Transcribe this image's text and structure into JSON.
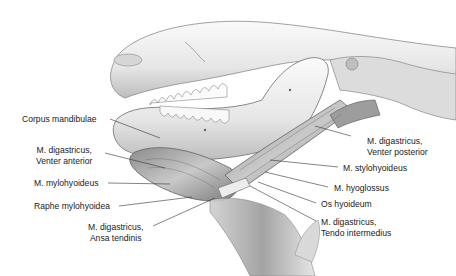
{
  "figure": {
    "labels": [
      {
        "id": "corpus-mandibulae",
        "lines": [
          "Corpus mandibulae"
        ]
      },
      {
        "id": "digastricus-venter-anterior",
        "lines": [
          "M. digastricus,",
          "Venter anterior"
        ]
      },
      {
        "id": "mylohyoideus",
        "lines": [
          "M. mylohyoideus"
        ]
      },
      {
        "id": "raphe-mylohyoidea",
        "lines": [
          "Raphe mylohyoidea"
        ]
      },
      {
        "id": "digastricus-ansa-tendinis",
        "lines": [
          "M. digastricus,",
          "Ansa tendinis"
        ]
      },
      {
        "id": "digastricus-venter-posterior",
        "lines": [
          "M. digastricus,",
          "Venter posterior"
        ]
      },
      {
        "id": "stylohyoideus",
        "lines": [
          "M. stylohyoideus"
        ]
      },
      {
        "id": "hyoglossus",
        "lines": [
          "M. hyoglossus"
        ]
      },
      {
        "id": "os-hyoideum",
        "lines": [
          "Os hyoideum"
        ]
      },
      {
        "id": "digastricus-tendo-intermedius",
        "lines": [
          "M. digastricus,",
          "Tendo intermedius"
        ]
      }
    ]
  },
  "colors": {
    "background": "#ffffff",
    "bone": "#ececec",
    "bone_shadow": "#9a9a9a",
    "muscle": "#b5b5b5",
    "muscle_dark": "#6e6e6e",
    "leader_line": "#333333",
    "text": "#222222"
  }
}
